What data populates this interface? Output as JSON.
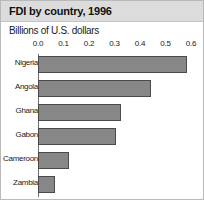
{
  "header": {
    "title": "FDI by country, 1996",
    "subtitle": "Billions of U.S. dollars"
  },
  "colors": {
    "bar_fill": "#878787",
    "bar_border": "#4a4a4a",
    "title_band": "#dcdcdc",
    "axis": "#6e6e6e",
    "frame": "#b9b9b9"
  },
  "chart_data": {
    "type": "bar",
    "orientation": "horizontal",
    "title": "FDI by country, 1996",
    "subtitle": "Billions of U.S. dollars",
    "xlabel": "Billions of U.S. dollars",
    "ylabel": "",
    "xlim": [
      0.0,
      0.6
    ],
    "grid": false,
    "legend": "none",
    "tick_labels": [
      "0.0",
      "0.1",
      "0.2",
      "0.3",
      "0.4",
      "0.5",
      "0.6"
    ],
    "ticks": [
      0.0,
      0.1,
      0.2,
      0.3,
      0.4,
      0.5,
      0.6
    ],
    "categories": [
      "Nigeria",
      "Angola",
      "Ghana",
      "Gabon",
      "Cameroon",
      "Zambia"
    ],
    "values": [
      0.585,
      0.445,
      0.325,
      0.305,
      0.12,
      0.065
    ]
  }
}
